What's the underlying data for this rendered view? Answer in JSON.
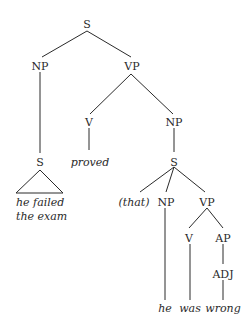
{
  "diagram": {
    "type": "syntax-tree",
    "nodes": {
      "s_root": "S",
      "np_subj": "NP",
      "vp_main": "VP",
      "s_subj": "S",
      "v_main": "V",
      "np_obj": "NP",
      "s_comp": "S",
      "np_comp": "NP",
      "vp_comp": "VP",
      "v_comp": "V",
      "ap_comp": "AP",
      "adj_comp": "ADJ"
    },
    "words": {
      "subj_line1": "he failed",
      "subj_line2": "the exam",
      "verb": "proved",
      "complementizer": "(that)",
      "comp_subj": "he",
      "comp_verb": "was",
      "comp_adj": "wrong"
    }
  }
}
